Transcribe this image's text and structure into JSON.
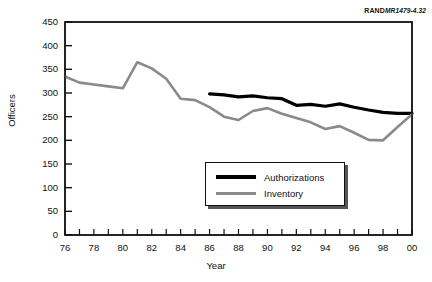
{
  "source_tag": {
    "brand": "RAND",
    "code": "MR1479-4.32"
  },
  "axes": {
    "ylabel": "Officers",
    "xlabel": "Year",
    "yticks": [
      "0",
      "50",
      "100",
      "150",
      "200",
      "250",
      "300",
      "350",
      "400",
      "450"
    ],
    "xticks": [
      "76",
      "78",
      "80",
      "82",
      "84",
      "86",
      "88",
      "90",
      "92",
      "94",
      "96",
      "98",
      "00"
    ]
  },
  "legend": {
    "items": [
      {
        "label": "Authorizations",
        "color": "#000000",
        "swatch": "auth"
      },
      {
        "label": "Inventory",
        "color": "#8a8a8a",
        "swatch": "inv"
      }
    ]
  },
  "chart_data": {
    "type": "line",
    "title": "",
    "xlabel": "Year",
    "ylabel": "Officers",
    "xlim": [
      76,
      100
    ],
    "ylim": [
      0,
      450
    ],
    "ytick_step": 50,
    "xtick_label_step": 2,
    "xtick_minor_step": 1,
    "grid": false,
    "legend_position": "inside-lower-center",
    "x": [
      76,
      77,
      78,
      79,
      80,
      81,
      82,
      83,
      84,
      85,
      86,
      87,
      88,
      89,
      90,
      91,
      92,
      93,
      94,
      95,
      96,
      97,
      98,
      99,
      100
    ],
    "series": [
      {
        "name": "Authorizations",
        "color": "#000000",
        "linewidth": 3.2,
        "x": [
          86,
          87,
          88,
          89,
          90,
          91,
          92,
          93,
          94,
          95,
          96,
          97,
          98,
          99,
          100
        ],
        "values": [
          298,
          296,
          292,
          294,
          290,
          288,
          274,
          276,
          272,
          277,
          270,
          264,
          259,
          257,
          257
        ]
      },
      {
        "name": "Inventory",
        "color": "#8a8a8a",
        "linewidth": 2.6,
        "x": [
          76,
          77,
          78,
          79,
          80,
          81,
          82,
          83,
          84,
          85,
          86,
          87,
          88,
          89,
          90,
          91,
          92,
          93,
          94,
          95,
          96,
          97,
          98,
          99,
          100
        ],
        "values": [
          335,
          322,
          318,
          314,
          310,
          365,
          352,
          330,
          288,
          285,
          270,
          250,
          243,
          262,
          268,
          256,
          247,
          238,
          224,
          230,
          216,
          201,
          200,
          228,
          255
        ]
      }
    ]
  }
}
